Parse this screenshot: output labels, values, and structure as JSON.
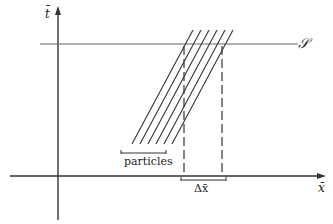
{
  "diagram": {
    "axes": {
      "x_label": "x̄",
      "y_label": "t̄"
    },
    "surface_label": "𝒮",
    "particles_label": "particles",
    "delta_label": "Δx̄",
    "num_worldlines": 5,
    "colors": {
      "line": "#333333",
      "surface_line": "#555555"
    }
  }
}
